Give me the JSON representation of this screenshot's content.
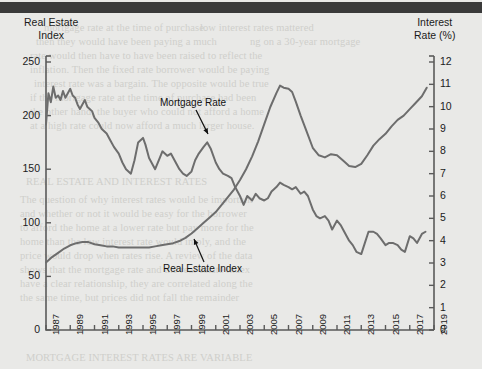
{
  "figure": {
    "background_color": "#e9e9e7",
    "line_color": "#6d6d6d",
    "axis_color": "#5a5a5a",
    "text_color": "#1b1b1b",
    "top_band_color": "#3a3a3a"
  },
  "axes": {
    "left_title_line1": "Real Estate",
    "left_title_line2": "Index",
    "right_title_line1": "Interest",
    "right_title_line2": "Rate (%)",
    "left_ticks": [
      "0",
      "50",
      "100",
      "150",
      "200",
      "250"
    ],
    "right_ticks": [
      "0",
      "1",
      "2",
      "3",
      "4",
      "5",
      "6",
      "7",
      "8",
      "9",
      "10",
      "11",
      "12"
    ],
    "x_ticks": [
      "1987",
      "1989",
      "1991",
      "1993",
      "1995",
      "1997",
      "1999",
      "2001",
      "2003",
      "2005",
      "2007",
      "2009",
      "2011",
      "2013",
      "2015",
      "2017",
      "2019"
    ]
  },
  "annotations": {
    "mortgage_label": "Mortgage Rate",
    "real_estate_label": "Real Estate Index"
  },
  "ghost_text": [
    {
      "x": 44,
      "y": 22,
      "text": "mortgage rate at the time of purchase."
    },
    {
      "x": 200,
      "y": 22,
      "text": "low interest rates mattered"
    },
    {
      "x": 36,
      "y": 36,
      "text": "then they would have been paying a much"
    },
    {
      "x": 250,
      "y": 36,
      "text": "ng on a 30-year mortgage"
    },
    {
      "x": 30,
      "y": 50,
      "text": "rate would then have to have been raised to reflect the"
    },
    {
      "x": 30,
      "y": 64,
      "text": "inflation. Then the fixed rate borrower would be paying"
    },
    {
      "x": 34,
      "y": 78,
      "text": "interest rate was a bargain. The opposite would be true"
    },
    {
      "x": 30,
      "y": 92,
      "text": "if the mortgage rate at the time of purchase had been"
    },
    {
      "x": 30,
      "y": 106,
      "text": "the other hand, the buyer who could not afford a home"
    },
    {
      "x": 30,
      "y": 120,
      "text": "at a high rate could now afford a much larger house."
    },
    {
      "x": 26,
      "y": 176,
      "text": "REAL ESTATE AND INTEREST RATES"
    },
    {
      "x": 20,
      "y": 194,
      "text": "The question of why interest rates would be important"
    },
    {
      "x": 20,
      "y": 208,
      "text": "and whether or not it would be easy for the borrower"
    },
    {
      "x": 20,
      "y": 222,
      "text": "to afford the home at a lower rate but pay more for the"
    },
    {
      "x": 20,
      "y": 236,
      "text": "home than the low interest rate would imply, and the"
    },
    {
      "x": 20,
      "y": 250,
      "text": "price would drop when rates rise. A review of the data"
    },
    {
      "x": 20,
      "y": 264,
      "text": "shows that the mortgage rate and the real estate index"
    },
    {
      "x": 20,
      "y": 278,
      "text": "have a clear relationship, they are correlated along the"
    },
    {
      "x": 20,
      "y": 292,
      "text": "the same time, but prices did not fall the remainder"
    },
    {
      "x": 26,
      "y": 352,
      "text": "MORTGAGE INTEREST RATES ARE VARIABLE"
    }
  ],
  "chart_data": {
    "type": "line",
    "title": "",
    "xlabel": "",
    "ylabel_left": "Real Estate Index",
    "ylabel_right": "Interest Rate (%)",
    "xlim": [
      1987,
      2019
    ],
    "ylim_left": [
      0,
      250
    ],
    "ylim_right": [
      0,
      12
    ],
    "grid": false,
    "legend": "annotations-on-plot",
    "series": [
      {
        "name": "Mortgage Rate",
        "axis": "right",
        "unit": "%",
        "x": [
          1987.0,
          1987.2,
          1987.4,
          1987.6,
          1987.8,
          1988.0,
          1988.2,
          1988.4,
          1988.6,
          1988.8,
          1989.0,
          1989.2,
          1989.4,
          1989.6,
          1989.8,
          1990.0,
          1990.2,
          1990.4,
          1990.6,
          1990.8,
          1991.0,
          1991.3,
          1991.6,
          1992.0,
          1992.3,
          1992.6,
          1993.0,
          1993.3,
          1993.6,
          1994.0,
          1994.3,
          1994.6,
          1995.0,
          1995.2,
          1995.5,
          1995.8,
          1996.0,
          1996.3,
          1996.6,
          1997.0,
          1997.3,
          1997.6,
          1998.0,
          1998.3,
          1998.6,
          1999.0,
          1999.3,
          1999.6,
          2000.0,
          2000.3,
          2000.6,
          2001.0,
          2001.3,
          2001.6,
          2002.0,
          2002.3,
          2002.6,
          2003.0,
          2003.3,
          2003.6,
          2004.0,
          2004.3,
          2004.6,
          2005.0,
          2005.3,
          2005.6,
          2006.0,
          2006.3,
          2006.6,
          2007.0,
          2007.3,
          2007.6,
          2008.0,
          2008.3,
          2008.6,
          2009.0,
          2009.3,
          2009.6,
          2010.0,
          2010.3,
          2010.6,
          2011.0,
          2011.3,
          2011.6,
          2012.0,
          2012.3,
          2012.6,
          2013.0,
          2013.3,
          2013.6,
          2014.0,
          2014.3,
          2014.6,
          2015.0,
          2015.3,
          2015.6,
          2016.0,
          2016.3,
          2016.6,
          2017.0,
          2017.3,
          2017.6,
          2018.0,
          2018.3
        ],
        "values": [
          9.2,
          10.6,
          10.2,
          10.9,
          10.4,
          10.5,
          10.3,
          10.7,
          10.4,
          10.6,
          10.8,
          10.5,
          10.4,
          10.1,
          9.9,
          10.1,
          10.3,
          10.0,
          9.9,
          9.8,
          9.5,
          9.3,
          9.0,
          8.8,
          8.5,
          8.2,
          7.9,
          7.5,
          7.2,
          7.0,
          7.6,
          8.4,
          8.6,
          8.3,
          7.7,
          7.4,
          7.2,
          7.6,
          8.0,
          7.8,
          7.9,
          7.6,
          7.2,
          7.0,
          6.9,
          7.1,
          7.6,
          7.9,
          8.2,
          8.4,
          8.1,
          7.5,
          7.2,
          7.0,
          6.9,
          6.8,
          6.4,
          6.0,
          5.6,
          6.0,
          5.8,
          6.1,
          5.9,
          5.8,
          5.9,
          6.2,
          6.4,
          6.6,
          6.5,
          6.4,
          6.3,
          6.4,
          6.1,
          6.2,
          6.0,
          5.4,
          5.1,
          5.0,
          5.1,
          4.9,
          4.5,
          4.9,
          4.7,
          4.4,
          4.0,
          3.8,
          3.5,
          3.4,
          3.9,
          4.4,
          4.4,
          4.3,
          4.1,
          3.8,
          3.9,
          3.9,
          3.8,
          3.6,
          3.5,
          4.2,
          4.1,
          3.9,
          4.3,
          4.4
        ]
      },
      {
        "name": "Real Estate Index",
        "axis": "left",
        "unit": "index",
        "x": [
          1987.0,
          1987.5,
          1988.0,
          1988.5,
          1989.0,
          1989.5,
          1990.0,
          1990.5,
          1991.0,
          1991.5,
          1992.0,
          1992.5,
          1993.0,
          1993.5,
          1994.0,
          1994.5,
          1995.0,
          1995.5,
          1996.0,
          1996.5,
          1997.0,
          1997.5,
          1998.0,
          1998.5,
          1999.0,
          1999.5,
          2000.0,
          2000.5,
          2001.0,
          2001.5,
          2002.0,
          2002.5,
          2003.0,
          2003.5,
          2004.0,
          2004.5,
          2005.0,
          2005.5,
          2006.0,
          2006.3,
          2006.6,
          2007.0,
          2007.3,
          2007.6,
          2008.0,
          2008.5,
          2009.0,
          2009.5,
          2010.0,
          2010.5,
          2011.0,
          2011.5,
          2012.0,
          2012.5,
          2013.0,
          2013.5,
          2014.0,
          2014.5,
          2015.0,
          2015.5,
          2016.0,
          2016.5,
          2017.0,
          2017.5,
          2018.0,
          2018.4
        ],
        "values": [
          63,
          68,
          72,
          76,
          79,
          81,
          82,
          82,
          80,
          79,
          78,
          78,
          77,
          77,
          77,
          77,
          77,
          77,
          78,
          79,
          80,
          81,
          83,
          86,
          90,
          95,
          100,
          105,
          110,
          117,
          124,
          131,
          140,
          150,
          162,
          176,
          192,
          208,
          221,
          228,
          226,
          225,
          222,
          213,
          200,
          185,
          170,
          163,
          161,
          164,
          163,
          158,
          153,
          152,
          155,
          163,
          172,
          178,
          183,
          190,
          196,
          200,
          206,
          212,
          218,
          226
        ]
      }
    ]
  }
}
